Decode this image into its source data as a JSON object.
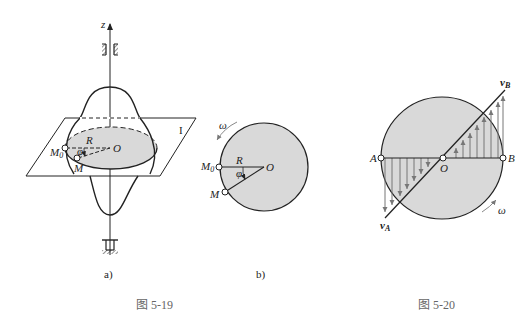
{
  "figure_5_19": {
    "caption": "图  5-19",
    "subfig_a": {
      "label": "a)",
      "axis_label": "z",
      "plane_label": "I",
      "center_label": "O",
      "radius_label": "R",
      "angle_label": "φ",
      "point_start_label": "M",
      "point_start_sub": "0",
      "point_label": "M"
    },
    "subfig_b": {
      "label": "b)",
      "omega_label": "ω",
      "center_label": "O",
      "radius_label": "R",
      "angle_label": "φ",
      "point_start_label": "M",
      "point_start_sub": "0",
      "point_label": "M"
    }
  },
  "figure_5_20": {
    "caption": "图  5-20",
    "left_point_label": "A",
    "right_point_label": "B",
    "center_label": "O",
    "velocity_a_label": "v",
    "velocity_a_sub": "A",
    "velocity_b_label": "v",
    "velocity_b_sub": "B",
    "omega_label": "ω"
  },
  "colors": {
    "fill_gray": "#d9d9d9",
    "line": "#222222",
    "arrow_gray": "#888888"
  }
}
